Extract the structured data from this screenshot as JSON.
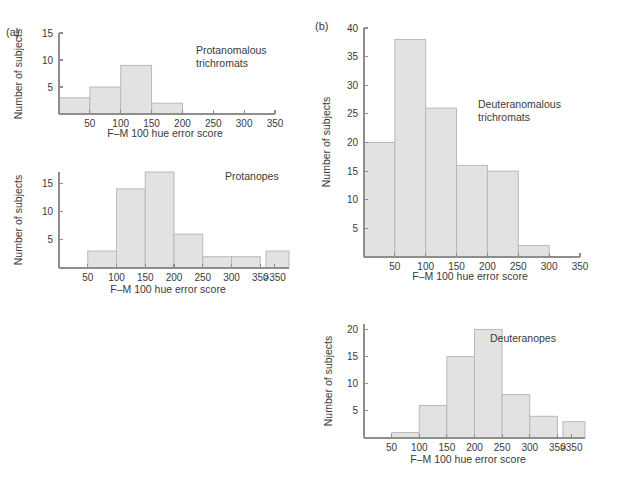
{
  "figure": {
    "background_color": "#ffffff",
    "bar_fill_color": "#e2e2e2",
    "bar_stroke_color": "#b9b9b9",
    "axis_color": "#8e8e8e",
    "text_color": "#3a3a3a",
    "panels": [
      {
        "id": "a",
        "label": "(a)"
      },
      {
        "id": "b",
        "label": "(b)"
      }
    ]
  },
  "chart_data": [
    {
      "id": "protanomalous-trichromats",
      "panel": "(a)",
      "position": "top-left",
      "type": "bar",
      "title": "",
      "annotation": "Protanomalous\ntrichromats",
      "annotation_lines": [
        "Protanomalous",
        "trichromats"
      ],
      "xlabel": "F–M 100 hue error score",
      "ylabel": "Number of subjects",
      "xlim": [
        0,
        350
      ],
      "ylim": [
        0,
        15
      ],
      "xticks": [
        50,
        100,
        150,
        200,
        250,
        300,
        350
      ],
      "xtick_labels": [
        "50",
        "100",
        "150",
        "200",
        "250",
        "300",
        "350"
      ],
      "yticks": [
        5,
        10,
        15
      ],
      "ytick_labels": [
        "5",
        "10",
        "15"
      ],
      "bin_width": 50,
      "grid": false,
      "legend": "none",
      "categories": [
        "0–50",
        "50–100",
        "100–150",
        "150–200"
      ],
      "bins": [
        {
          "start": 0,
          "end": 50,
          "value": 3
        },
        {
          "start": 50,
          "end": 100,
          "value": 5
        },
        {
          "start": 100,
          "end": 150,
          "value": 9
        },
        {
          "start": 150,
          "end": 200,
          "value": 2
        }
      ],
      "values": [
        3,
        5,
        9,
        2
      ]
    },
    {
      "id": "protanopes",
      "panel": "(a)",
      "position": "bottom-left",
      "type": "bar",
      "title": "",
      "annotation": "Protanopes",
      "annotation_lines": [
        "Protanopes"
      ],
      "xlabel": "F–M 100 hue error score",
      "ylabel": "Number of subjects",
      "xlim": [
        0,
        400
      ],
      "ylim": [
        0,
        17
      ],
      "xticks": [
        50,
        100,
        150,
        200,
        250,
        300,
        350,
        375
      ],
      "xtick_labels": [
        "50",
        "100",
        "150",
        "200",
        "250",
        "300",
        "350",
        ">350"
      ],
      "yticks": [
        5,
        10,
        15
      ],
      "ytick_labels": [
        "5",
        "10",
        "15"
      ],
      "bin_width": 50,
      "grid": false,
      "legend": "none",
      "has_axis_break": true,
      "categories": [
        "50–100",
        "100–150",
        "150–200",
        "200–250",
        "250–300",
        "300–350",
        ">350"
      ],
      "bins": [
        {
          "start": 50,
          "end": 100,
          "value": 3
        },
        {
          "start": 100,
          "end": 150,
          "value": 14
        },
        {
          "start": 150,
          "end": 200,
          "value": 17
        },
        {
          "start": 200,
          "end": 250,
          "value": 6
        },
        {
          "start": 250,
          "end": 300,
          "value": 2
        },
        {
          "start": 300,
          "end": 350,
          "value": 2
        },
        {
          "start": 360,
          "end": 400,
          "value": 3
        }
      ],
      "values": [
        3,
        14,
        17,
        6,
        2,
        2,
        3
      ]
    },
    {
      "id": "deuteranomalous-trichromats",
      "panel": "(b)",
      "position": "top-right",
      "type": "bar",
      "title": "",
      "annotation": "Deuteranomalous\ntrichromats",
      "annotation_lines": [
        "Deuteranomalous",
        "trichromats"
      ],
      "xlabel": "F–M 100 hue error score",
      "ylabel": "Number of subjects",
      "xlim": [
        0,
        350
      ],
      "ylim": [
        0,
        40
      ],
      "xticks": [
        50,
        100,
        150,
        200,
        250,
        300,
        350
      ],
      "xtick_labels": [
        "50",
        "100",
        "150",
        "200",
        "250",
        "300",
        "350"
      ],
      "yticks": [
        5,
        10,
        15,
        20,
        25,
        30,
        35,
        40
      ],
      "ytick_labels": [
        "5",
        "10",
        "15",
        "20",
        "25",
        "30",
        "35",
        "40"
      ],
      "bin_width": 50,
      "grid": false,
      "legend": "none",
      "categories": [
        "0–50",
        "50–100",
        "100–150",
        "150–200",
        "200–250",
        "250–300"
      ],
      "bins": [
        {
          "start": 0,
          "end": 50,
          "value": 20
        },
        {
          "start": 50,
          "end": 100,
          "value": 38
        },
        {
          "start": 100,
          "end": 150,
          "value": 26
        },
        {
          "start": 150,
          "end": 200,
          "value": 16
        },
        {
          "start": 200,
          "end": 250,
          "value": 15
        },
        {
          "start": 250,
          "end": 300,
          "value": 2
        }
      ],
      "values": [
        20,
        38,
        26,
        16,
        15,
        2
      ]
    },
    {
      "id": "deuteranopes",
      "panel": "(b)",
      "position": "bottom-right",
      "type": "bar",
      "title": "",
      "annotation": "Deuteranopes",
      "annotation_lines": [
        "Deuteranopes"
      ],
      "xlabel": "F–M 100 hue error score",
      "ylabel": "Number of subjects",
      "xlim": [
        0,
        400
      ],
      "ylim": [
        0,
        21
      ],
      "xticks": [
        50,
        100,
        150,
        200,
        250,
        300,
        350,
        375
      ],
      "xtick_labels": [
        "50",
        "100",
        "150",
        "200",
        "250",
        "300",
        "350",
        ">350"
      ],
      "yticks": [
        5,
        10,
        15,
        20
      ],
      "ytick_labels": [
        "5",
        "10",
        "15",
        "20"
      ],
      "bin_width": 50,
      "grid": false,
      "legend": "none",
      "has_axis_break": true,
      "categories": [
        "50–100",
        "100–150",
        "150–200",
        "200–250",
        "250–300",
        "300–350",
        ">350"
      ],
      "bins": [
        {
          "start": 50,
          "end": 100,
          "value": 1
        },
        {
          "start": 100,
          "end": 150,
          "value": 6
        },
        {
          "start": 150,
          "end": 200,
          "value": 15
        },
        {
          "start": 200,
          "end": 250,
          "value": 20
        },
        {
          "start": 250,
          "end": 300,
          "value": 8
        },
        {
          "start": 300,
          "end": 350,
          "value": 4
        },
        {
          "start": 360,
          "end": 400,
          "value": 3
        }
      ],
      "values": [
        1,
        6,
        15,
        20,
        8,
        4,
        3
      ]
    }
  ]
}
